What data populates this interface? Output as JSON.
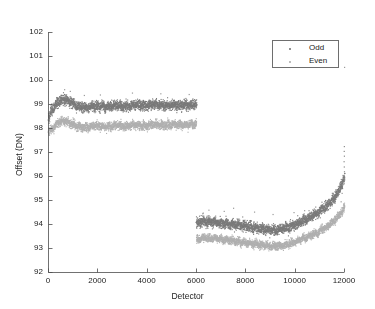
{
  "chart_data": {
    "type": "scatter",
    "title": "",
    "xlabel": "Detector",
    "ylabel": "Offset (DN)",
    "xlim": [
      0,
      12000
    ],
    "ylim": [
      92,
      102
    ],
    "xticks": [
      0,
      2000,
      4000,
      6000,
      8000,
      10000,
      12000
    ],
    "xticklabels": [
      "0",
      "2000",
      "4000",
      "6000",
      "8000",
      "10000",
      "12000"
    ],
    "yticks": [
      92,
      93,
      94,
      95,
      96,
      97,
      98,
      99,
      100,
      101,
      102
    ],
    "yticklabels": [
      "92",
      "93",
      "94",
      "95",
      "96",
      "97",
      "98",
      "99",
      "100",
      "101",
      "102"
    ],
    "grid": false,
    "legend": {
      "position": "top-right",
      "entries": [
        {
          "name": "Odd",
          "color": "#7a7a7a"
        },
        {
          "name": "Even",
          "color": "#b0b0b0"
        }
      ]
    },
    "marker_size": 1.1,
    "segments": [
      {
        "name": "left-bank",
        "x_range": [
          0,
          6000
        ],
        "n_points": 900,
        "series": [
          {
            "name": "Odd",
            "color": "#7a7a7a",
            "baseline": 98.95,
            "noise": 0.17,
            "control_points": [
              [
                0,
                98.45
              ],
              [
                150,
                98.8
              ],
              [
                400,
                99.1
              ],
              [
                650,
                99.22
              ],
              [
                900,
                99.12
              ],
              [
                1200,
                98.92
              ],
              [
                1500,
                98.88
              ],
              [
                1900,
                98.95
              ],
              [
                2300,
                98.9
              ],
              [
                2700,
                98.97
              ],
              [
                3100,
                98.92
              ],
              [
                3500,
                99.0
              ],
              [
                3900,
                98.95
              ],
              [
                4300,
                99.02
              ],
              [
                4700,
                98.96
              ],
              [
                5100,
                99.0
              ],
              [
                5500,
                98.97
              ],
              [
                6000,
                99.0
              ]
            ]
          },
          {
            "name": "Even",
            "color": "#b0b0b0",
            "baseline": 98.1,
            "noise": 0.14,
            "control_points": [
              [
                0,
                97.85
              ],
              [
                150,
                98.0
              ],
              [
                400,
                98.26
              ],
              [
                650,
                98.33
              ],
              [
                900,
                98.22
              ],
              [
                1200,
                98.08
              ],
              [
                1500,
                98.05
              ],
              [
                1900,
                98.12
              ],
              [
                2300,
                98.08
              ],
              [
                2700,
                98.13
              ],
              [
                3100,
                98.09
              ],
              [
                3500,
                98.16
              ],
              [
                3900,
                98.11
              ],
              [
                4300,
                98.18
              ],
              [
                4700,
                98.13
              ],
              [
                5100,
                98.18
              ],
              [
                5500,
                98.15
              ],
              [
                6000,
                98.2
              ]
            ]
          }
        ]
      },
      {
        "name": "right-bank",
        "x_range": [
          6000,
          12000
        ],
        "n_points": 900,
        "series": [
          {
            "name": "Odd",
            "color": "#7a7a7a",
            "baseline": 94.05,
            "noise": 0.17,
            "control_points": [
              [
                6000,
                94.05
              ],
              [
                6300,
                94.12
              ],
              [
                6700,
                94.1
              ],
              [
                7100,
                94.05
              ],
              [
                7500,
                94.0
              ],
              [
                7900,
                93.95
              ],
              [
                8300,
                93.88
              ],
              [
                8700,
                93.82
              ],
              [
                9100,
                93.78
              ],
              [
                9400,
                93.8
              ],
              [
                9700,
                93.88
              ],
              [
                10000,
                94.0
              ],
              [
                10400,
                94.2
              ],
              [
                10800,
                94.42
              ],
              [
                11200,
                94.7
              ],
              [
                11500,
                95.0
              ],
              [
                11750,
                95.35
              ],
              [
                11900,
                95.7
              ],
              [
                12000,
                95.95
              ]
            ]
          },
          {
            "name": "Even",
            "color": "#b0b0b0",
            "baseline": 93.4,
            "noise": 0.13,
            "control_points": [
              [
                6000,
                93.38
              ],
              [
                6300,
                93.45
              ],
              [
                6700,
                93.42
              ],
              [
                7100,
                93.38
              ],
              [
                7500,
                93.32
              ],
              [
                7900,
                93.26
              ],
              [
                8300,
                93.2
              ],
              [
                8700,
                93.14
              ],
              [
                9100,
                93.1
              ],
              [
                9400,
                93.12
              ],
              [
                9700,
                93.18
              ],
              [
                10000,
                93.28
              ],
              [
                10400,
                93.45
              ],
              [
                10800,
                93.62
              ],
              [
                11200,
                93.85
              ],
              [
                11500,
                94.08
              ],
              [
                11750,
                94.32
              ],
              [
                11900,
                94.55
              ],
              [
                12000,
                94.72
              ]
            ]
          }
        ]
      }
    ],
    "outliers": [
      {
        "x": 11990,
        "y": 97.25,
        "color": "#8a8a8a"
      },
      {
        "x": 11985,
        "y": 97.05,
        "color": "#8a8a8a"
      },
      {
        "x": 11992,
        "y": 96.85,
        "color": "#8a8a8a"
      },
      {
        "x": 11980,
        "y": 96.62,
        "color": "#8a8a8a"
      },
      {
        "x": 11988,
        "y": 96.4,
        "color": "#8a8a8a"
      },
      {
        "x": 11995,
        "y": 96.2,
        "color": "#8a8a8a"
      },
      {
        "x": 11978,
        "y": 96.02,
        "color": "#8a8a8a"
      },
      {
        "x": 11990,
        "y": 95.8,
        "color": "#8a8a8a"
      },
      {
        "x": 11860,
        "y": 94.95,
        "color": "#9a9a9a"
      },
      {
        "x": 11900,
        "y": 95.3,
        "color": "#9a9a9a"
      },
      {
        "x": 11500,
        "y": 94.78,
        "color": "#9a9a9a"
      },
      {
        "x": 11250,
        "y": 94.72,
        "color": "#9a9a9a"
      },
      {
        "x": 10800,
        "y": 94.62,
        "color": "#9a9a9a"
      },
      {
        "x": 10380,
        "y": 94.58,
        "color": "#9a9a9a"
      },
      {
        "x": 9950,
        "y": 94.5,
        "color": "#9a9a9a"
      },
      {
        "x": 9100,
        "y": 94.42,
        "color": "#9a9a9a"
      },
      {
        "x": 8350,
        "y": 94.52,
        "color": "#9a9a9a"
      },
      {
        "x": 7500,
        "y": 94.68,
        "color": "#9a9a9a"
      },
      {
        "x": 7120,
        "y": 94.55,
        "color": "#9a9a9a"
      },
      {
        "x": 6500,
        "y": 94.6,
        "color": "#9a9a9a"
      },
      {
        "x": 6250,
        "y": 94.45,
        "color": "#9a9a9a"
      },
      {
        "x": 12000,
        "y": 100.55,
        "color": "#9a9a9a"
      },
      {
        "x": 650,
        "y": 99.62,
        "color": "#9a9a9a"
      },
      {
        "x": 880,
        "y": 99.55,
        "color": "#9a9a9a"
      },
      {
        "x": 3400,
        "y": 99.48,
        "color": "#9a9a9a"
      },
      {
        "x": 4550,
        "y": 99.45,
        "color": "#9a9a9a"
      },
      {
        "x": 5700,
        "y": 99.42,
        "color": "#9a9a9a"
      },
      {
        "x": 2100,
        "y": 99.4,
        "color": "#9a9a9a"
      },
      {
        "x": 1450,
        "y": 99.38,
        "color": "#9a9a9a"
      }
    ]
  },
  "plot_geometry": {
    "left": 48,
    "right": 344,
    "top": 32,
    "bottom": 272,
    "axis_color": "#4d4d4d",
    "background": "#ffffff"
  }
}
